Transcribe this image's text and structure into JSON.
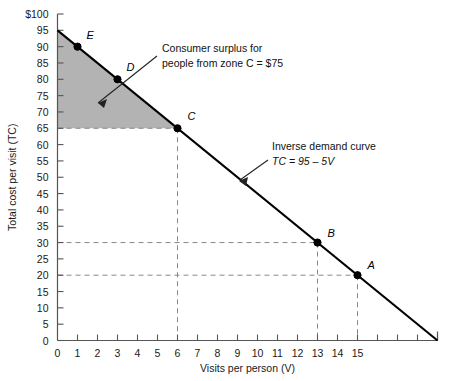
{
  "chart_data": {
    "type": "line",
    "title": "",
    "xlabel": "Visits per person (V)",
    "ylabel": "Total cost per visit (TC)",
    "xlim": [
      0,
      19
    ],
    "ylim": [
      0,
      100
    ],
    "grid": false,
    "legend_position": "none",
    "series": [
      {
        "name": "Inverse demand curve",
        "equation": "TC = 95 - 5V",
        "x": [
          0,
          19
        ],
        "y": [
          95,
          0
        ]
      }
    ],
    "x_ticks": [
      0,
      1,
      2,
      3,
      4,
      5,
      6,
      7,
      8,
      9,
      10,
      11,
      12,
      13,
      14,
      15,
      16,
      17,
      18,
      19
    ],
    "x_tick_labels": [
      "0",
      "1",
      "2",
      "3",
      "4",
      "5",
      "6",
      "7",
      "8",
      "9",
      "10",
      "11",
      "12",
      "13",
      "14",
      "15",
      "",
      "",
      "",
      ""
    ],
    "y_ticks": [
      0,
      5,
      10,
      15,
      20,
      25,
      30,
      35,
      40,
      45,
      50,
      55,
      60,
      65,
      70,
      75,
      80,
      85,
      90,
      95,
      100
    ],
    "y_tick_labels": [
      "0",
      "5",
      "10",
      "15",
      "20",
      "25",
      "30",
      "35",
      "40",
      "45",
      "50",
      "55",
      "60",
      "65",
      "70",
      "75",
      "80",
      "85",
      "90",
      "95",
      "$100"
    ],
    "points": [
      {
        "label": "E",
        "x": 1,
        "y": 90
      },
      {
        "label": "D",
        "x": 3,
        "y": 80
      },
      {
        "label": "C",
        "x": 6,
        "y": 65
      },
      {
        "label": "B",
        "x": 13,
        "y": 30
      },
      {
        "label": "A",
        "x": 15,
        "y": 20
      }
    ],
    "shaded_region": {
      "name": "consumer surplus triangle",
      "vertices": [
        [
          0,
          95
        ],
        [
          0,
          65
        ],
        [
          6,
          65
        ]
      ],
      "color": "#b3b3b3"
    },
    "annotations": [
      {
        "name": "consumer-surplus",
        "lines": [
          "Consumer surplus for",
          "people from zone C = $75"
        ],
        "value": 75
      },
      {
        "name": "inverse-demand",
        "lines": [
          "Inverse demand curve",
          "TC = 95 - 5V"
        ]
      }
    ],
    "dashed_guides": [
      {
        "y": 65,
        "x": 6
      },
      {
        "y": 30,
        "x": 13
      },
      {
        "y": 20,
        "x": 15
      }
    ],
    "colors": {
      "line": "#000000",
      "shade": "#b3b3b3",
      "axis": "#555555",
      "dashed": "#888888",
      "text": "#111111"
    }
  }
}
